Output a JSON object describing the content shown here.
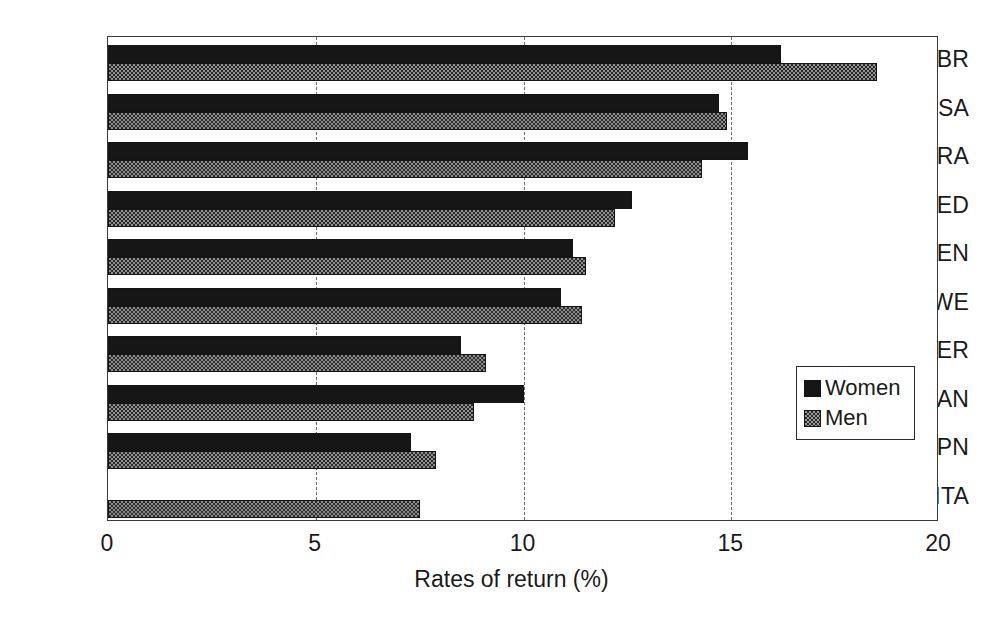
{
  "chart_data": {
    "type": "bar",
    "orientation": "horizontal",
    "title": "",
    "xlabel": "Rates of return (%)",
    "ylabel": "",
    "xlim": [
      0,
      20
    ],
    "xticks": [
      "0",
      "5",
      "10",
      "15",
      "20"
    ],
    "xtick_values": [
      0,
      5,
      10,
      15,
      20
    ],
    "grid": "vertical-dashed-at-5-10-15",
    "legend_position": "right-middle",
    "categories": [
      "GBR",
      "USA",
      "FRA",
      "NED",
      "DEN",
      "SWE",
      "GER",
      "CAN",
      "JPN",
      "ITA"
    ],
    "series": [
      {
        "name": "Women",
        "values": [
          16.2,
          14.7,
          15.4,
          12.6,
          11.2,
          10.9,
          8.5,
          10.0,
          7.3,
          0
        ]
      },
      {
        "name": "Men",
        "values": [
          18.5,
          14.9,
          14.3,
          12.2,
          11.5,
          11.4,
          9.1,
          8.8,
          7.9,
          7.5
        ]
      }
    ]
  },
  "legend": {
    "entries": [
      {
        "label": "Women",
        "swatch": "solid-black"
      },
      {
        "label": "Men",
        "swatch": "gray-checker"
      }
    ]
  }
}
